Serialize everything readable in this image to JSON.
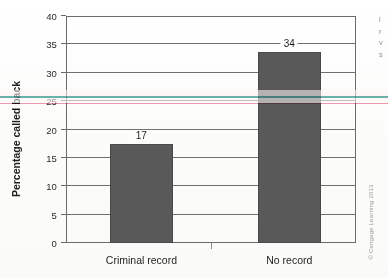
{
  "chart_data": {
    "type": "bar",
    "title": "",
    "subtitle": "",
    "categories": [
      "Criminal record",
      "No record"
    ],
    "values": [
      17,
      34
    ],
    "plotted_values": [
      17.5,
      33.7
    ],
    "data_labels": [
      "17",
      "34"
    ],
    "xlabel": "",
    "ylabel": "Percentage called back",
    "ylim": [
      0,
      40
    ],
    "ytick_step": 5,
    "yticks": [
      0,
      5,
      10,
      15,
      20,
      25,
      30,
      35,
      40
    ],
    "ytick_labels": [
      "0",
      "5",
      "10",
      "15",
      "20",
      "25",
      "30",
      "35",
      "40"
    ],
    "grid": true,
    "grid_axis": "y",
    "legend": false,
    "legend_position": "none",
    "series": [
      {
        "name": "Percentage called back",
        "values": [
          17,
          34
        ],
        "color": "#595959"
      }
    ]
  },
  "credit": {
    "text": "© Cengage Learning 2013"
  },
  "margin_text": {
    "lines": [
      "l",
      "r",
      "v",
      "s"
    ]
  },
  "colors": {
    "bar_fill": "#595959",
    "axis": "#6b6b6b",
    "gridline": "#707070",
    "text": "#1f1f1f",
    "background": "#fdfdfc",
    "artifact_teal": "#2f9d93",
    "artifact_pink": "#e8607e"
  }
}
